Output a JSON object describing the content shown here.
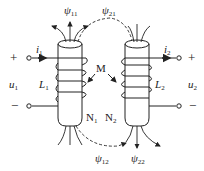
{
  "left_coil": {
    "current": "i",
    "current_sub": "1",
    "voltage": "u",
    "voltage_sub": "1",
    "inductance": "L",
    "inductance_sub": "1",
    "turns": "N",
    "turns_sub": "1",
    "plus": "+",
    "minus": "−"
  },
  "right_coil": {
    "current": "i",
    "current_sub": "2",
    "voltage": "u",
    "voltage_sub": "2",
    "inductance": "L",
    "inductance_sub": "2",
    "turns": "N",
    "turns_sub": "2",
    "plus": "+",
    "minus": "−"
  },
  "mutual": "M",
  "flux": {
    "psi11": {
      "sym": "ψ",
      "sub": "11"
    },
    "psi21": {
      "sym": "ψ",
      "sub": "21"
    },
    "psi12": {
      "sym": "ψ",
      "sub": "12"
    },
    "psi22": {
      "sym": "ψ",
      "sub": "22"
    }
  },
  "colors": {
    "stroke": "#222222",
    "background": "#ffffff"
  }
}
